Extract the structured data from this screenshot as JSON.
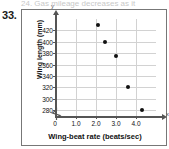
{
  "question": {
    "number": "33.",
    "cut_header_text": "24. Gas mileage decreases as it"
  },
  "chart_data": {
    "type": "scatter",
    "title": "",
    "xlabel": "Wing-beat rate (beats/sec)",
    "ylabel": "Wing length (mm)",
    "xlim": [
      0,
      5.0
    ],
    "ylim": [
      270,
      440
    ],
    "y_axis_break": true,
    "grid": true,
    "legend": "none",
    "x_ticks": [
      "0",
      "1.0",
      "2.0",
      "3.0",
      "4.0"
    ],
    "x_tick_values": [
      0,
      1.0,
      2.0,
      3.0,
      4.0
    ],
    "y_ticks": [
      "280",
      "300",
      "320",
      "340",
      "360",
      "380",
      "400",
      "420"
    ],
    "y_tick_values": [
      280,
      300,
      320,
      340,
      360,
      380,
      400,
      420
    ],
    "axis_tip_x": "x",
    "axis_tip_y": "y",
    "origin_label": "0",
    "points": [
      {
        "x": 2.1,
        "y": 430
      },
      {
        "x": 2.45,
        "y": 400
      },
      {
        "x": 3.0,
        "y": 375
      },
      {
        "x": 3.6,
        "y": 321
      },
      {
        "x": 4.3,
        "y": 281
      }
    ]
  },
  "colors": {
    "point": "#111111",
    "grid": "#d2d2d2",
    "axis": "#555555",
    "border": "#777777",
    "text": "#111111"
  }
}
